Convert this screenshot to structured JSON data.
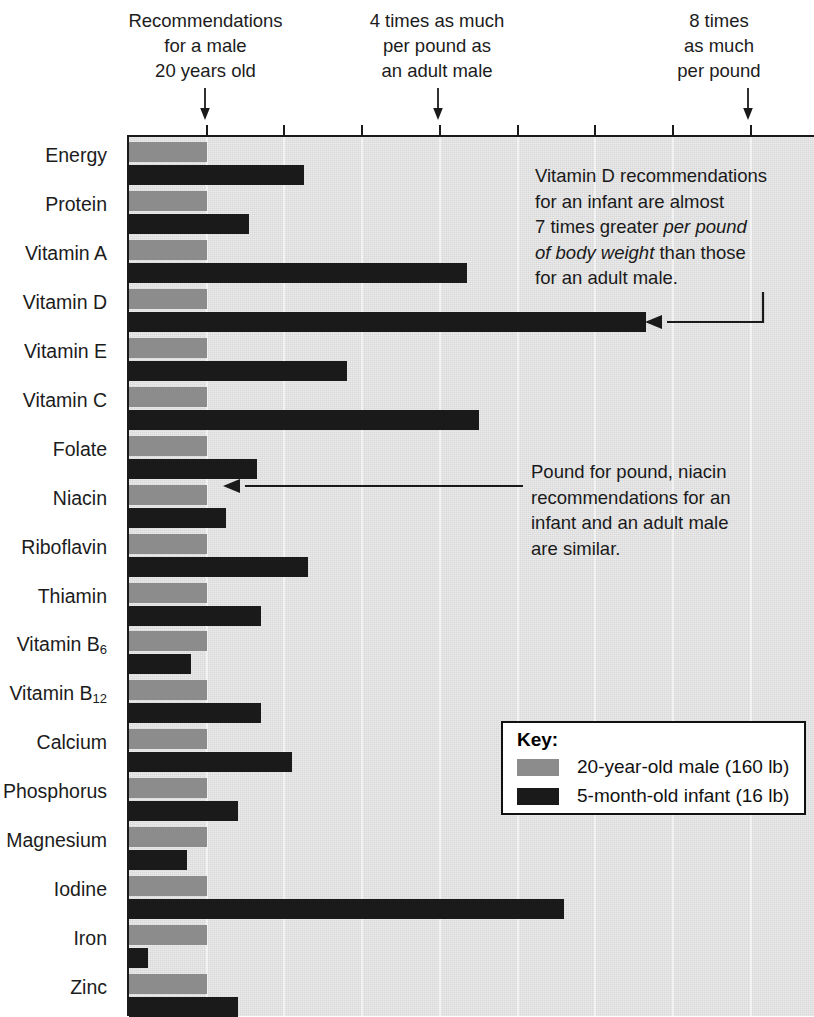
{
  "top_notes": [
    {
      "id": "recommendations-note",
      "text": "Recommendations\nfor a male\n20 years old"
    },
    {
      "id": "four-times-note",
      "text": "4 times as much\nper pound as\nan adult male"
    },
    {
      "id": "eight-times-note",
      "text": "8 times\nas much\nper pound"
    }
  ],
  "annotations": [
    {
      "id": "vitamin-d-annotation",
      "line1": "Vitamin D recommendations",
      "line2": "for an infant are almost",
      "line3_a": "7 times greater ",
      "line3_em": "per pound",
      "line4_em": "of body weight",
      "line4_b": " than those",
      "line5": "for an adult male."
    },
    {
      "id": "niacin-annotation",
      "line1": "Pound for pound, niacin",
      "line2": "recommendations for an",
      "line3": "infant and an adult male",
      "line4": "are similar."
    }
  ],
  "key": {
    "title": "Key:",
    "entries": [
      {
        "label": "20-year-old male (160 lb)",
        "color": "#8c8c8c"
      },
      {
        "label": "5-month-old infant (16 lb)",
        "color": "#1a1a1a"
      }
    ]
  },
  "colors": {
    "adult_bar": "#8c8c8c",
    "infant_bar": "#1a1a1a",
    "plot_background": "#d9d9d9",
    "gridline": "#f2f2f2",
    "axis": "#1a1a1a"
  },
  "chart_data": {
    "type": "bar",
    "orientation": "horizontal",
    "title": "",
    "xlabel": "",
    "ylabel": "",
    "xlim": [
      0,
      8.84
    ],
    "x_unit": "multiple of the adult-male recommendation per pound of body weight",
    "grid": true,
    "gridline_values": [
      1,
      2,
      3,
      4,
      5,
      6,
      7,
      8
    ],
    "legend_position": "inside-bottom-right",
    "categories": [
      "Energy",
      "Protein",
      "Vitamin A",
      "Vitamin D",
      "Vitamin E",
      "Vitamin C",
      "Folate",
      "Niacin",
      "Riboflavin",
      "Thiamin",
      "Vitamin B6",
      "Vitamin B12",
      "Calcium",
      "Phosphorus",
      "Magnesium",
      "Iodine",
      "Iron",
      "Zinc"
    ],
    "category_labels": [
      {
        "text": "Energy",
        "sub": ""
      },
      {
        "text": "Protein",
        "sub": ""
      },
      {
        "text": "Vitamin A",
        "sub": ""
      },
      {
        "text": "Vitamin D",
        "sub": ""
      },
      {
        "text": "Vitamin E",
        "sub": ""
      },
      {
        "text": "Vitamin C",
        "sub": ""
      },
      {
        "text": "Folate",
        "sub": ""
      },
      {
        "text": "Niacin",
        "sub": ""
      },
      {
        "text": "Riboflavin",
        "sub": ""
      },
      {
        "text": "Thiamin",
        "sub": ""
      },
      {
        "text": "Vitamin B",
        "sub": "6"
      },
      {
        "text": "Vitamin B",
        "sub": "12"
      },
      {
        "text": "Calcium",
        "sub": ""
      },
      {
        "text": "Phosphorus",
        "sub": ""
      },
      {
        "text": "Magnesium",
        "sub": ""
      },
      {
        "text": "Iodine",
        "sub": ""
      },
      {
        "text": "Iron",
        "sub": ""
      },
      {
        "text": "Zinc",
        "sub": ""
      }
    ],
    "series": [
      {
        "name": "20-year-old male (160 lb)",
        "color": "#8c8c8c",
        "values": [
          1,
          1,
          1,
          1,
          1,
          1,
          1,
          1,
          1,
          1,
          1,
          1,
          1,
          1,
          1,
          1,
          1,
          1
        ]
      },
      {
        "name": "5-month-old infant (16 lb)",
        "color": "#1a1a1a",
        "values": [
          2.25,
          1.55,
          4.35,
          6.65,
          2.8,
          4.5,
          1.65,
          1.25,
          2.3,
          1.7,
          0.8,
          1.7,
          2.1,
          1.4,
          0.75,
          5.6,
          0.25,
          1.4
        ]
      }
    ]
  }
}
